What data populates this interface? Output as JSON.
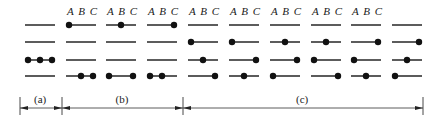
{
  "columns": [
    {
      "x": 25,
      "header": "",
      "dots": [
        [],
        [],
        [
          0.1,
          0.5,
          0.9
        ],
        []
      ],
      "bottom_dots_override": null
    },
    {
      "x": 66,
      "header": "A B C",
      "dots": [
        [
          0.1
        ],
        [],
        [],
        [
          0.5,
          0.9
        ]
      ]
    },
    {
      "x": 106,
      "header": "A B C",
      "dots": [
        [
          0.5
        ],
        [],
        [],
        [
          0.1,
          0.9
        ]
      ]
    },
    {
      "x": 147,
      "header": "A B C",
      "dots": [
        [
          0.9
        ],
        [],
        [],
        [
          0.1,
          0.5
        ]
      ]
    },
    {
      "x": 188,
      "header": "A B C",
      "dots": [
        [],
        [
          0.1
        ],
        [
          0.5
        ],
        [
          0.9
        ]
      ]
    },
    {
      "x": 229,
      "header": "A B C",
      "dots": [
        [],
        [
          0.1
        ],
        [
          0.9
        ],
        [
          0.5
        ]
      ]
    },
    {
      "x": 270,
      "header": "A B C",
      "dots": [
        [],
        [
          0.5
        ],
        [
          0.9
        ],
        [
          0.1
        ]
      ]
    },
    {
      "x": 311,
      "header": "A B C",
      "dots": [
        [],
        [
          0.5
        ],
        [
          0.1
        ],
        [
          0.9
        ]
      ]
    },
    {
      "x": 351,
      "header": "A B C",
      "dots": [
        [],
        [
          0.9
        ],
        [
          0.1
        ],
        [
          0.5
        ]
      ]
    },
    {
      "x": 392,
      "header": "",
      "dots": [
        [],
        [
          0.9
        ],
        [
          0.5
        ],
        [
          0.1
        ]
      ]
    }
  ],
  "rows_y": [
    25,
    42,
    60,
    76
  ],
  "line_width": 30,
  "groups": [
    {
      "label": "(a)",
      "x1": 20,
      "x2": 62
    },
    {
      "label": "(b)",
      "x1": 62,
      "x2": 183
    },
    {
      "label": "(c)",
      "x1": 183,
      "x2": 423
    }
  ]
}
